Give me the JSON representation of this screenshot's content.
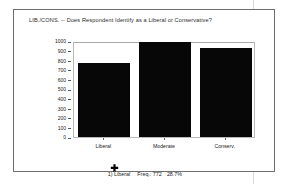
{
  "figure": {
    "title": "LIB./CONS. -- Does Respondent Identify as a Liberal or Conservative?",
    "annotation": {
      "index_label": "1) Liberal",
      "freq_label": "Freq.: 772",
      "percent_label": "28.7%"
    },
    "marker_icon": "cursor-pointer-icon",
    "bar_color": "#070707",
    "frame_color": "#6e6e6e"
  },
  "chart_data": {
    "type": "bar",
    "title": "LIB./CONS. -- Does Respondent Identify as a Liberal or Conservative?",
    "categories": [
      "Liberal",
      "Moderate",
      "Conserv."
    ],
    "values": [
      772,
      990,
      930
    ],
    "xlabel": "",
    "ylabel": "",
    "ylim": [
      0,
      1000
    ],
    "yticks": [
      0,
      100,
      200,
      300,
      400,
      500,
      600,
      700,
      800,
      900,
      1000
    ],
    "ytick_labels": [
      "0",
      "100",
      "200",
      "300",
      "400",
      "500",
      "600",
      "700",
      "800",
      "900",
      "1000"
    ],
    "grid": false,
    "legend": "none",
    "selected_category": "Liberal",
    "selected_frequency": 772,
    "selected_percent": "28.7%"
  }
}
